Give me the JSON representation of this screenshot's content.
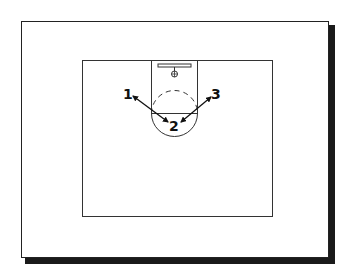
{
  "diagram": {
    "type": "basketball-half-court-play",
    "players": [
      {
        "id": "1",
        "label": "1",
        "x": 128,
        "y": 97
      },
      {
        "id": "2",
        "label": "2",
        "x": 174,
        "y": 129
      },
      {
        "id": "3",
        "label": "3",
        "x": 216,
        "y": 97
      }
    ],
    "passes": [
      {
        "from": "2",
        "to": "1",
        "bidirectional": true
      },
      {
        "from": "2",
        "to": "3",
        "bidirectional": true
      }
    ],
    "colors": {
      "line": "#222222",
      "background": "#ffffff",
      "shadow": "#1a1a1a"
    }
  }
}
